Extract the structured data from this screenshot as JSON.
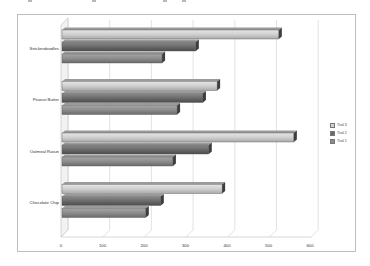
{
  "chart_data": {
    "type": "bar",
    "orientation": "horizontal",
    "style": "3d-clustered",
    "title": "",
    "xlabel": "",
    "ylabel": "",
    "categories": [
      "Chocolate Chip",
      "Oatmeal Raisin",
      "Peanut Butter",
      "Snickerdoodles"
    ],
    "series": [
      {
        "name": "Trial 1",
        "color": "#8c8c8c",
        "values": [
          201,
          266,
          276,
          240
        ]
      },
      {
        "name": "Trial 2",
        "color": "#6b6b6b",
        "values": [
          237,
          352,
          338,
          321
        ]
      },
      {
        "name": "Trial 3",
        "color": "#d2d2d2",
        "values": [
          384,
          556,
          372,
          520
        ]
      }
    ],
    "xlim": [
      0,
      600
    ],
    "x_ticks": [
      "0",
      "100",
      "200",
      "300",
      "400",
      "500",
      "600"
    ],
    "grid": true,
    "legend_position": "right",
    "legend_order": [
      "Trial 3",
      "Trial 2",
      "Trial 1"
    ]
  },
  "labels": {
    "categories_top_to_bottom": [
      "Snickerdoodles",
      "Peanut Butter",
      "Oatmeal Raisin",
      "Chocolate Chip"
    ],
    "ticks": [
      "0",
      "100",
      "200",
      "300",
      "400",
      "500",
      "600"
    ],
    "legend": [
      "Trial 3",
      "Trial 2",
      "Trial 1"
    ]
  }
}
